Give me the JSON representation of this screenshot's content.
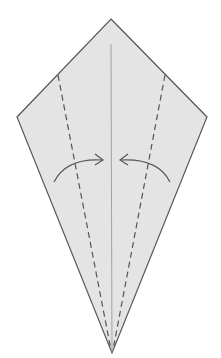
{
  "diagram": {
    "title": "Kite base: valley fold both edges to center line",
    "paper_color": "#e4e4e4",
    "edge_color": "#555555",
    "fold_line_color": "#555555",
    "center_crease_color": "#9a9a9a",
    "elements": {
      "paper": "kite-shaped paper",
      "center_crease": "center crease",
      "left_fold": "valley fold line (left)",
      "right_fold": "valley fold line (right)",
      "left_arrow": "fold arrow toward center (left)",
      "right_arrow": "fold arrow toward center (right)"
    }
  }
}
